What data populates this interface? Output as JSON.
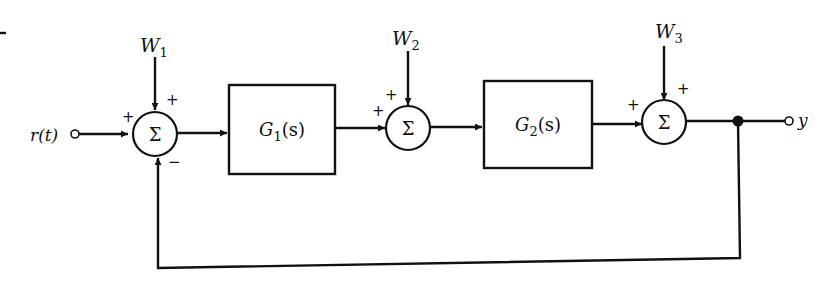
{
  "diagram": {
    "type": "block-diagram",
    "title": "",
    "input": {
      "label": "r(t)"
    },
    "output": {
      "label": "y"
    },
    "disturbances": [
      {
        "id": "W1",
        "label": "W",
        "sub": "1"
      },
      {
        "id": "W2",
        "label": "W",
        "sub": "2"
      },
      {
        "id": "W3",
        "label": "W",
        "sub": "3"
      }
    ],
    "blocks": [
      {
        "id": "G1",
        "label": "G",
        "sub": "1",
        "arg": "(s)"
      },
      {
        "id": "G2",
        "label": "G",
        "sub": "2",
        "arg": "(s)"
      }
    ],
    "summing_junctions": [
      {
        "id": "S1",
        "symbol": "Σ",
        "input_signs": {
          "left": "+",
          "top": "+",
          "bottom": "−"
        }
      },
      {
        "id": "S2",
        "symbol": "Σ",
        "input_signs": {
          "left": "+",
          "top": "+"
        }
      },
      {
        "id": "S3",
        "symbol": "Σ",
        "input_signs": {
          "left": "+",
          "top": "+"
        }
      }
    ],
    "connections": [
      "r(t) -> S1 (+)",
      "W1 -> S1 (+)",
      "S1 -> G1",
      "G1 -> S2 (+)",
      "W2 -> S2 (+)",
      "S2 -> G2",
      "G2 -> S3 (+)",
      "W3 -> S3 (+)",
      "S3 -> y",
      "y -> S1 (−) [feedback]"
    ],
    "colors": {
      "stroke": "#111111",
      "background": "#ffffff"
    }
  }
}
